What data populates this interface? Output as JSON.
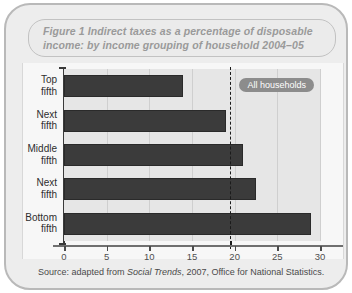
{
  "figure": {
    "title": "Figure 1 Indirect taxes as a percentage of disposable income: by income grouping of household 2004–05",
    "source_prefix": "Source: adapted from ",
    "source_italic": "Social Trends",
    "source_suffix": ", 2007, Office for National Statistics."
  },
  "annotation": {
    "all_households_label": "All households",
    "all_households_value": 19.5
  },
  "colors": {
    "bar": "#3b3b3b",
    "plot_background": "#e6e6e6",
    "frame": "#ededed",
    "title_text": "#9a9a9a",
    "pill_background": "#8c8c8c",
    "average_line": "#1b1b1b"
  },
  "chart_data": {
    "type": "bar",
    "orientation": "horizontal",
    "title": "Figure 1 Indirect taxes as a percentage of disposable income: by income grouping of household 2004–05",
    "xlabel": "",
    "ylabel": "",
    "categories": [
      "Top fifth",
      "Next fifth",
      "Middle fifth",
      "Next fifth",
      "Bottom fifth"
    ],
    "values": [
      14,
      19,
      21,
      22.5,
      29
    ],
    "xlim": [
      0,
      30
    ],
    "xticks": [
      0,
      5,
      10,
      15,
      20,
      25,
      30
    ],
    "xtick_labels": [
      "0",
      "5",
      "10",
      "15",
      "20",
      "25",
      "30"
    ],
    "grid": true,
    "legend": "none",
    "annotations": [
      {
        "label": "All households",
        "value": 19.5,
        "style": "dashed-vertical-line"
      }
    ]
  }
}
